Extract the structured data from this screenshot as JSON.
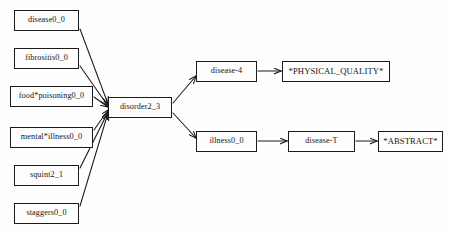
{
  "figure": {
    "type": "directed-graph",
    "background_color": "#fefefe",
    "node_border_color": "#1b1b1b",
    "edge_color": "#1b1b1b",
    "text_color": "#141414"
  },
  "nodes": [
    {
      "id": "disease0_0",
      "label": "disease0_0",
      "x": 14,
      "y": 10,
      "w": 65,
      "h": 21,
      "font_size": 8.2
    },
    {
      "id": "fibrositis0_0",
      "label": "fibrositis0_0",
      "x": 14,
      "y": 48,
      "w": 65,
      "h": 21,
      "font_size": 8.2
    },
    {
      "id": "food_poisoning0_0",
      "label": "food*poisoning0_0",
      "x": 10,
      "y": 86,
      "w": 83,
      "h": 21,
      "font_size": 8.2
    },
    {
      "id": "mental_illness0_0",
      "label": "mental*illness0_0",
      "x": 10,
      "y": 127,
      "w": 83,
      "h": 21,
      "font_size": 8.2
    },
    {
      "id": "squint2_1",
      "label": "squint2_1",
      "x": 14,
      "y": 165,
      "w": 65,
      "h": 21,
      "font_size": 8.2
    },
    {
      "id": "staggers0_0",
      "label": "staggers0_0",
      "x": 14,
      "y": 203,
      "w": 65,
      "h": 21,
      "font_size": 8.2
    },
    {
      "id": "disorder2_3",
      "label": "disorder2_3",
      "x": 108,
      "y": 97,
      "w": 64,
      "h": 21,
      "font_size": 8.2
    },
    {
      "id": "disease-4",
      "label": "disease-4",
      "x": 196,
      "y": 61,
      "w": 61,
      "h": 21,
      "font_size": 8.2
    },
    {
      "id": "physical_quality",
      "label": "*PHYSICAL_QUALITY*",
      "x": 282,
      "y": 61,
      "w": 108,
      "h": 21,
      "font_size": 8.6
    },
    {
      "id": "illness0_0",
      "label": "illness0_0",
      "x": 196,
      "y": 131,
      "w": 61,
      "h": 21,
      "font_size": 8.2
    },
    {
      "id": "disease-T",
      "label": "disease-T",
      "x": 288,
      "y": 131,
      "w": 67,
      "h": 21,
      "font_size": 8.2
    },
    {
      "id": "abstract",
      "label": "*ABSTRACT*",
      "x": 378,
      "y": 131,
      "w": 65,
      "h": 21,
      "font_size": 8.6
    }
  ],
  "edges": [
    {
      "id": "e1",
      "from": "disease0_0",
      "to": "disorder2_3",
      "path": "M 80,29 L 108,104"
    },
    {
      "id": "e2",
      "from": "fibrositis0_0",
      "to": "disorder2_3",
      "path": "M 80,66 L 108,106"
    },
    {
      "id": "e3",
      "from": "food_poisoning0_0",
      "to": "disorder2_3",
      "path": "M 94,97 L 108,107"
    },
    {
      "id": "e4",
      "from": "mental_illness0_0",
      "to": "disorder2_3",
      "path": "M 94,130 L 108,110"
    },
    {
      "id": "e5",
      "from": "squint2_1",
      "to": "disorder2_3",
      "path": "M 80,168 L 108,112"
    },
    {
      "id": "e6",
      "from": "staggers0_0",
      "to": "disorder2_3",
      "path": "M 80,206 L 108,113"
    },
    {
      "id": "e7",
      "from": "disorder2_3",
      "to": "disease-4",
      "path": "M 173,103 L 196,76"
    },
    {
      "id": "e8",
      "from": "disorder2_3",
      "to": "illness0_0",
      "path": "M 173,113 L 196,138"
    },
    {
      "id": "e9",
      "from": "disease-4",
      "to": "physical_quality",
      "path": "M 258,71 L 281,71"
    },
    {
      "id": "e10",
      "from": "illness0_0",
      "to": "disease-T",
      "path": "M 258,141 L 287,141"
    },
    {
      "id": "e11",
      "from": "disease-T",
      "to": "abstract",
      "path": "M 356,141 L 377,141"
    }
  ]
}
